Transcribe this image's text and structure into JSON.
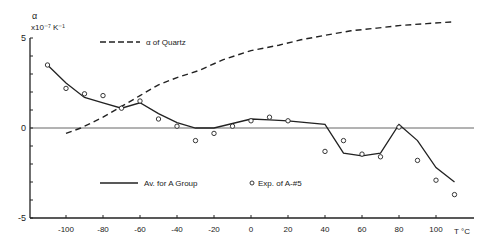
{
  "chart_data": {
    "type": "line",
    "title": "",
    "ylabel_line1": "α",
    "ylabel_line2": "x10⁻⁷ K⁻¹",
    "xlabel": "T °C",
    "xlim": [
      -118,
      118
    ],
    "ylim": [
      -5,
      5
    ],
    "x_ticks": [
      -100,
      -80,
      -60,
      -40,
      -20,
      0,
      20,
      40,
      60,
      80,
      100
    ],
    "y_tick_labels": [
      5,
      0,
      -5
    ],
    "y_minor_step": 1,
    "grid": false,
    "legend": [
      {
        "name": "α of Quartz",
        "style": "dashed"
      },
      {
        "name": "Av. for A Group",
        "style": "solid"
      },
      {
        "name": "Exp. of A-#5",
        "style": "circle-marker"
      }
    ],
    "series": [
      {
        "name": "α of Quartz",
        "style": "dashed",
        "x": [
          -100,
          -92,
          -80,
          -70,
          -60,
          -50,
          -40,
          -28,
          -15,
          0,
          15,
          27,
          40,
          54,
          68,
          81,
          95,
          110
        ],
        "y": [
          -0.3,
          0.0,
          0.6,
          1.2,
          1.8,
          2.4,
          2.8,
          3.2,
          3.8,
          4.3,
          4.6,
          4.9,
          5.15,
          5.4,
          5.55,
          5.7,
          5.8,
          5.9
        ]
      },
      {
        "name": "Av. for A Group",
        "style": "solid",
        "x": [
          -110,
          -100,
          -90,
          -80,
          -70,
          -60,
          -50,
          -40,
          -30,
          -20,
          -10,
          0,
          10,
          20,
          30,
          40,
          50,
          60,
          70,
          80,
          90,
          100,
          110
        ],
        "y": [
          3.5,
          2.5,
          1.7,
          1.4,
          1.1,
          1.4,
          0.8,
          0.3,
          0.0,
          0.0,
          0.25,
          0.5,
          0.45,
          0.4,
          0.3,
          0.2,
          -1.4,
          -1.55,
          -1.4,
          0.2,
          -0.7,
          -2.2,
          -3.0
        ]
      },
      {
        "name": "Exp. of A-#5",
        "style": "markers",
        "x": [
          -110,
          -100,
          -90,
          -80,
          -70,
          -60,
          -50,
          -40,
          -30,
          -20,
          -10,
          0,
          10,
          20,
          40,
          50,
          60,
          70,
          80,
          90,
          100,
          110
        ],
        "y": [
          3.5,
          2.2,
          1.9,
          1.8,
          1.1,
          1.5,
          0.5,
          0.1,
          -0.7,
          -0.3,
          0.1,
          0.4,
          0.6,
          0.4,
          -1.3,
          -0.7,
          -1.45,
          -1.6,
          0.05,
          -1.8,
          -2.9,
          -3.7
        ]
      }
    ]
  }
}
